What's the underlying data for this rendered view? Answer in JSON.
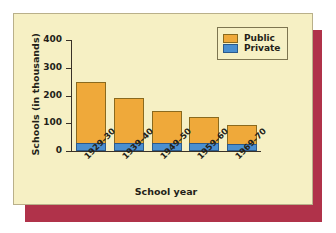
{
  "card": {
    "background_color": "#f6f0c4",
    "shadow_color": "#b0324a"
  },
  "legend": {
    "position": "top-right",
    "entries": [
      {
        "label": "Public",
        "color": "#efa93a"
      },
      {
        "label": "Private",
        "color": "#4a8fd0"
      }
    ]
  },
  "chart_data": {
    "type": "bar",
    "subtype": "stacked-bar",
    "title": "",
    "xlabel": "School year",
    "ylabel": "Schools (in thousands)",
    "categories": [
      "1929–30",
      "1939–40",
      "1949–50",
      "1959–60",
      "1969–70"
    ],
    "series": [
      {
        "name": "Private",
        "color": "#4a8fd0",
        "values": [
          30,
          30,
          30,
          28,
          25
        ]
      },
      {
        "name": "Public",
        "color": "#efa93a",
        "values": [
          220,
          162,
          113,
          94,
          67
        ]
      }
    ],
    "totals": [
      250,
      192,
      143,
      122,
      92
    ],
    "ylim": [
      0,
      400
    ],
    "yticks": [
      0,
      100,
      200,
      300,
      400
    ],
    "ytick_labels": [
      "0",
      "100",
      "200",
      "300",
      "400"
    ],
    "grid": false,
    "legend_position": "top-right"
  }
}
